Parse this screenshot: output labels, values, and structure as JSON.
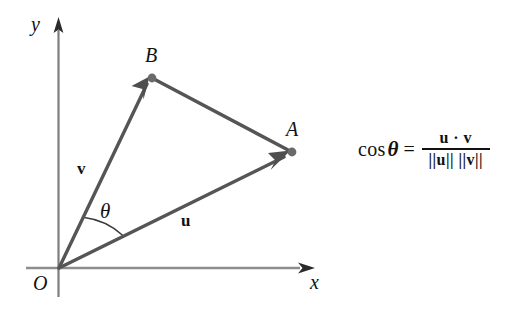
{
  "figure": {
    "background_color": "#ffffff",
    "axis_color": "#8a8a8a",
    "vector_color": "#555555",
    "label_color": "#111111"
  },
  "axes": {
    "y_label": "y",
    "x_label": "x",
    "origin_label": "O"
  },
  "points": [
    {
      "name": "B",
      "label": "B",
      "x": 152,
      "y": 78
    },
    {
      "name": "A",
      "label": "A",
      "x": 292,
      "y": 152
    }
  ],
  "vectors": [
    {
      "name": "v",
      "label": "v",
      "from": "O",
      "to": "B"
    },
    {
      "name": "u",
      "label": "u",
      "from": "O",
      "to": "A"
    }
  ],
  "segments": [
    {
      "name": "BA",
      "from": "B",
      "to": "A",
      "arrow": false
    }
  ],
  "angle": {
    "label": "θ",
    "between": [
      "v",
      "u"
    ],
    "vertex": "O"
  },
  "formula": {
    "lhs": "cos",
    "lhs_theta": "θ",
    "equals": "=",
    "numerator": "u · v",
    "denominator": "||u|| ||v||"
  }
}
